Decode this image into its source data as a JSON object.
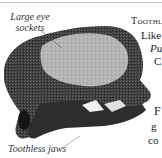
{
  "figure": {
    "labels": {
      "eye_sockets": [
        "Large eye",
        "sockets"
      ],
      "jaws": "Toothless jaws"
    }
  },
  "body_text": {
    "line1": "Toothl",
    "line2": "Like",
    "line3": "Pu",
    "line4": "C",
    "line5": "F",
    "line6": "g",
    "line7": "co"
  },
  "colors": {
    "background": "#ffffff",
    "skull_dark": "#3a3a3a",
    "eye_socket": "#b8b8b8",
    "rule": "#c8c8c8"
  }
}
